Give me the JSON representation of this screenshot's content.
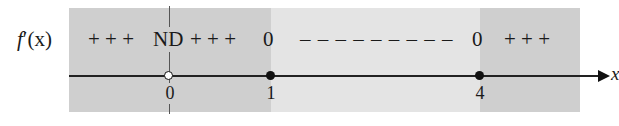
{
  "function_label": {
    "name": "f",
    "prime": "′",
    "args": "(x)"
  },
  "axis": {
    "variable": "x"
  },
  "sign_chart": {
    "segments": [
      {
        "text": "+ + +",
        "x": 88
      },
      {
        "text": "ND",
        "x": 152
      },
      {
        "text": "+ + +",
        "x": 190
      },
      {
        "text": "0",
        "x": 263
      },
      {
        "text": "– – – – – – – – –",
        "x": 300
      },
      {
        "text": "0",
        "x": 472
      },
      {
        "text": "+ + +",
        "x": 504
      }
    ]
  },
  "critical_points": [
    {
      "label": "0",
      "x": 170,
      "marker": "open"
    },
    {
      "label": "1",
      "x": 271,
      "marker": "filled"
    },
    {
      "label": "4",
      "x": 480,
      "marker": "filled"
    }
  ],
  "bands": [
    {
      "from": 69,
      "to": 271,
      "shade": "dark"
    },
    {
      "from": 271,
      "to": 480,
      "shade": "light"
    },
    {
      "from": 480,
      "to": 580,
      "shade": "dark"
    }
  ],
  "colors": {
    "dark_band": "#cfcfcf",
    "light_band": "#e4e4e4",
    "ink": "#111111"
  }
}
